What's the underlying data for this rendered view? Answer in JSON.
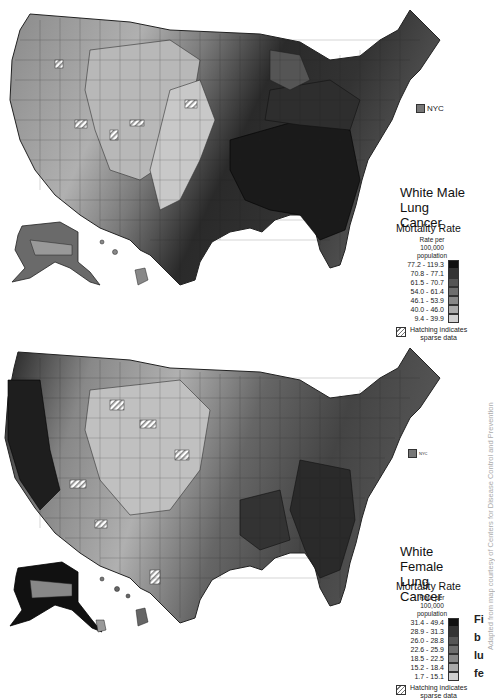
{
  "maps": [
    {
      "id": "male",
      "title_line1": "White Male",
      "title_line2": "Lung Cancer",
      "legend": {
        "heading": "Mortality Rate",
        "subheading": [
          "Rate per",
          "100,000",
          "population"
        ],
        "classes": [
          {
            "range": "77.2 - 119.3",
            "color": "#111111"
          },
          {
            "range": "70.8 - 77.1",
            "color": "#333333"
          },
          {
            "range": "61.5 - 70.7",
            "color": "#555555"
          },
          {
            "range": "54.0 - 61.4",
            "color": "#6e6e6e"
          },
          {
            "range": "46.1 - 53.9",
            "color": "#888888"
          },
          {
            "range": "40.0 - 46.0",
            "color": "#aaaaaa"
          },
          {
            "range": "9.4 - 39.9",
            "color": "#d0d0d0"
          }
        ],
        "hatch_line1": "Hatching indicates",
        "hatch_line2": "sparse data"
      },
      "nyc_label": "NYC"
    },
    {
      "id": "female",
      "title_line1": "White Female",
      "title_line2": "Lung Cancer",
      "legend": {
        "heading": "Mortality Rate",
        "subheading": [
          "Rate per",
          "100,000",
          "population"
        ],
        "classes": [
          {
            "range": "31.4 - 49.4",
            "color": "#111111"
          },
          {
            "range": "28.9 - 31.3",
            "color": "#333333"
          },
          {
            "range": "26.0 - 28.8",
            "color": "#555555"
          },
          {
            "range": "22.6 - 25.9",
            "color": "#6e6e6e"
          },
          {
            "range": "18.5 - 22.5",
            "color": "#888888"
          },
          {
            "range": "15.2 - 18.4",
            "color": "#aaaaaa"
          },
          {
            "range": "1.7 - 15.1",
            "color": "#d0d0d0"
          }
        ],
        "hatch_line1": "Hatching indicates",
        "hatch_line2": "sparse data"
      },
      "nyc_label": "NYC"
    }
  ],
  "credit": "Adapted from map courtesy of Centers for Disease Control and Prevention",
  "caption_fragments": [
    "Fi",
    "b",
    "lu",
    "fe"
  ]
}
